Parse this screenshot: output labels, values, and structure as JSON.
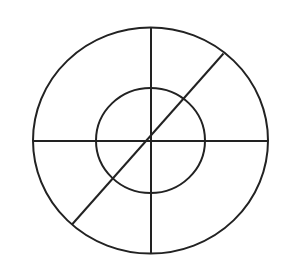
{
  "diagram": {
    "shapes": [
      {
        "name": "outer-circle",
        "kind": "circle"
      },
      {
        "name": "inner-circle",
        "kind": "circle"
      },
      {
        "name": "vertical-line",
        "kind": "line"
      },
      {
        "name": "horizontal-line",
        "kind": "line"
      },
      {
        "name": "diagonal-line",
        "kind": "line"
      }
    ],
    "stroke_color": "#222222",
    "background_color": "#ffffff"
  }
}
